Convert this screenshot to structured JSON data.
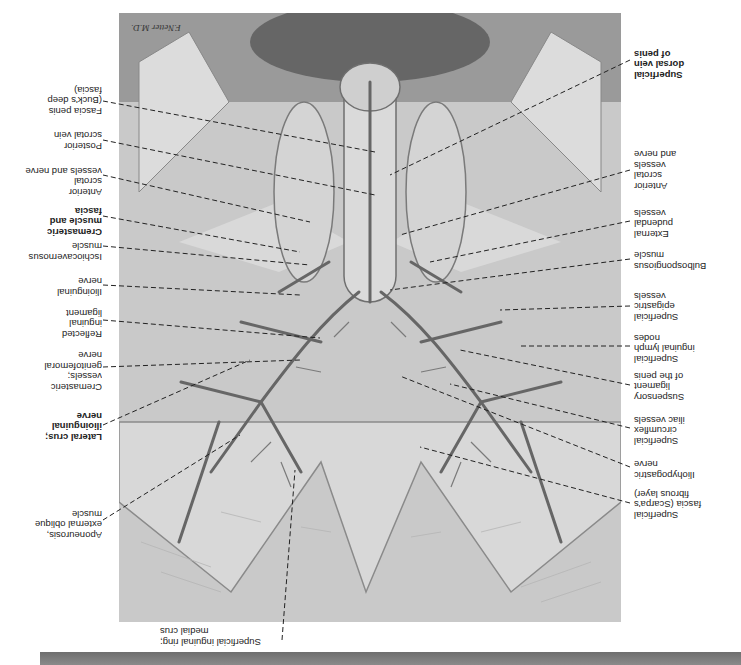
{
  "figure": {
    "orientation": "rotated 180 degrees",
    "signature": "F.Netter M.D.",
    "colors": {
      "background": "#ffffff",
      "illustration_mid": "#c8c8c8",
      "vessel": "#6a6a6a",
      "label_text": "#222222",
      "bottom_bar": "#7a7a7a"
    }
  },
  "labels_left": [
    {
      "text": "Fascia penis\n(Buck's deep\nfascia)",
      "bold": false
    },
    {
      "text": "Posterior\nscrotal vein",
      "bold": false
    },
    {
      "text": "Anterior\nscrotal\nvessels and nerve",
      "bold": false
    },
    {
      "text": "Cremasteric\nmuscle and\nfascia",
      "bold": true
    },
    {
      "text": "Ischiocavernosus\nmuscle",
      "bold": false
    },
    {
      "text": "Ilioinguinal\nnerve",
      "bold": false
    },
    {
      "text": "Reflected\ninguinal\nligament",
      "bold": false
    },
    {
      "text": "Cremasteric\nvessels;\ngenitofemoral\nnerve",
      "bold": false
    },
    {
      "text": "Lateral crus;\nilioinguinal\nnerve",
      "bold": true
    },
    {
      "text": "Aponeurosis,\nexternal oblique\nmuscle",
      "bold": false
    }
  ],
  "labels_right": [
    {
      "text": "Superficial\ndorsal vein\nof penis",
      "bold": true
    },
    {
      "text": "Anterior\nscrotal\nvessels\nand nerve",
      "bold": false
    },
    {
      "text": "External\npudendal\nvessels",
      "bold": false
    },
    {
      "text": "Bulbospongiosus\nmuscle",
      "bold": false
    },
    {
      "text": "Superficial\nepigastric\nvessels",
      "bold": false
    },
    {
      "text": "Superficial\ninguinal lymph\nnodes",
      "bold": false
    },
    {
      "text": "Suspensory\nligament\nof the penis",
      "bold": false
    },
    {
      "text": "Superficial\ncircumflex\niliac vessels",
      "bold": false
    },
    {
      "text": "Iliohypogastric\nnerve",
      "bold": false
    },
    {
      "text": "Superficial\nfascia (Scarpa's\nfibrous layer)",
      "bold": false
    }
  ],
  "labels_bottom": [
    {
      "text": "Superficial inguinal ring;\nmedial crus",
      "bold": false
    }
  ]
}
